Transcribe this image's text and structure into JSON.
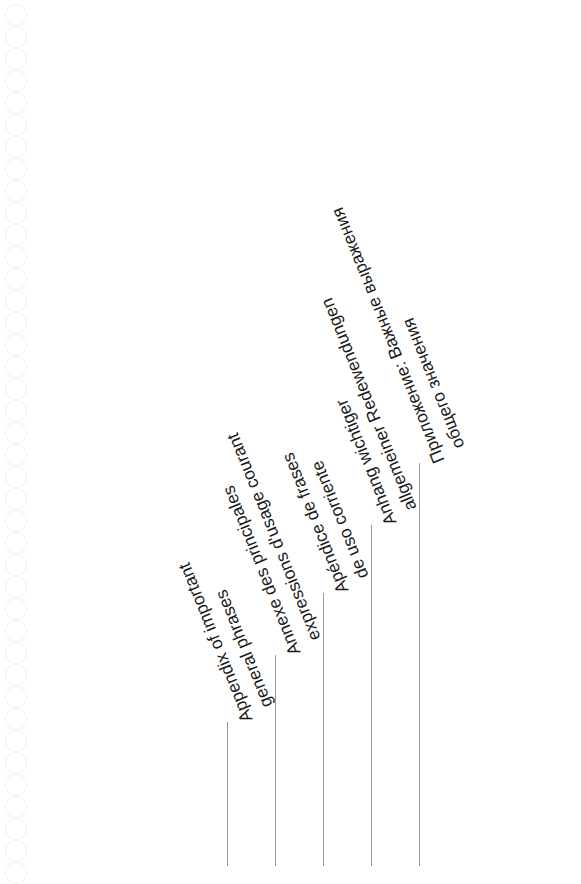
{
  "labels": [
    {
      "line1": "Appendix of important",
      "line2": "general phrases",
      "line_x": 227,
      "line_top": 722
    },
    {
      "line1": "Annexe des principales",
      "line2": "expressions d'usage courant",
      "line_x": 275,
      "line_top": 655
    },
    {
      "line1": "Apéndice de frases",
      "line2": "de uso corriente",
      "line_x": 323,
      "line_top": 593
    },
    {
      "line1": "Anhang wichtiger",
      "line2": "allgemeiner Redewendungen",
      "line_x": 371,
      "line_top": 525
    },
    {
      "line1": "Приложение: Важные выражения",
      "line2": "общего значения",
      "line_x": 419,
      "line_top": 463
    }
  ],
  "colors": {
    "text": "#1a1a1a",
    "rule": "#9a9a9a",
    "ring": "#f0f0f0",
    "background": "#ffffff"
  }
}
